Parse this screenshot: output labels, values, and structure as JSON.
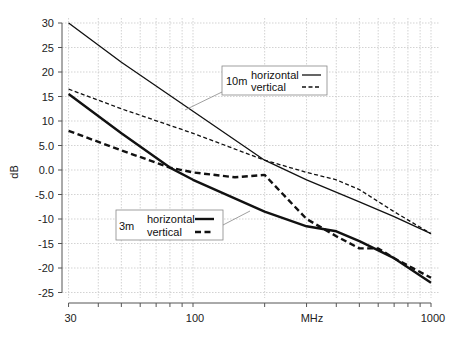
{
  "chart_data": {
    "type": "line",
    "title": "",
    "xlabel": "MHz",
    "ylabel": "dB",
    "xscale": "log",
    "xlim": [
      30,
      1000
    ],
    "ylim": [
      -25,
      30
    ],
    "grid": true,
    "x_tick_labels": [
      "30",
      "100",
      "1000"
    ],
    "y_tick_labels": [
      "30",
      "25",
      "20",
      "15",
      "10",
      "5.0",
      "0.0",
      "-5.0",
      "-10",
      "-15",
      "-20",
      "-25"
    ],
    "legends": [
      {
        "title": "10m",
        "entries": [
          "horizontal",
          "vertical"
        ]
      },
      {
        "title": "3m",
        "entries": [
          "horizontal",
          "vertical"
        ]
      }
    ],
    "series": [
      {
        "name": "10m horizontal",
        "style": "thin-solid",
        "x": [
          30,
          50,
          100,
          200,
          300,
          500,
          700,
          1000
        ],
        "y": [
          30,
          22,
          12,
          2,
          -2,
          -6.5,
          -9.5,
          -13
        ]
      },
      {
        "name": "10m vertical",
        "style": "thin-dashed",
        "x": [
          30,
          50,
          100,
          200,
          300,
          400,
          500,
          700,
          1000
        ],
        "y": [
          16.5,
          12.5,
          7.5,
          2,
          -0.5,
          -2,
          -4,
          -8.5,
          -13
        ]
      },
      {
        "name": "3m horizontal",
        "style": "thick-solid",
        "x": [
          30,
          50,
          80,
          100,
          200,
          300,
          400,
          500,
          700,
          1000
        ],
        "y": [
          15.5,
          7.5,
          0.5,
          -2,
          -8.5,
          -11.5,
          -12.5,
          -14.5,
          -18,
          -23
        ]
      },
      {
        "name": "3m vertical",
        "style": "thick-dashed",
        "x": [
          30,
          50,
          80,
          100,
          150,
          200,
          300,
          400,
          500,
          600,
          700,
          1000
        ],
        "y": [
          8,
          4,
          0.5,
          -0.5,
          -1.5,
          -1,
          -10,
          -13.5,
          -16,
          -16,
          -18,
          -22
        ]
      }
    ]
  }
}
